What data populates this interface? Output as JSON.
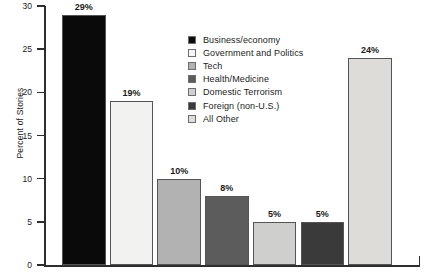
{
  "chart_data": {
    "type": "bar",
    "title": "",
    "xlabel": "",
    "ylabel": "Percent of Stories",
    "ylim": [
      0,
      30
    ],
    "ytick_step": 5,
    "ytick_labels": [
      "0",
      "5",
      "10",
      "15",
      "20",
      "25",
      "30"
    ],
    "grid": false,
    "legend_position": "inside-top-center",
    "categories": [
      "Business/economy",
      "Government and Politics",
      "Tech",
      "Health/Medicine",
      "Domestic Terrorism",
      "Foreign (non-U.S.)",
      "All Other"
    ],
    "values": [
      29,
      19,
      10,
      8,
      5,
      5,
      24
    ],
    "data_labels": [
      "29%",
      "19%",
      "10%",
      "8%",
      "5%",
      "5%",
      "24%"
    ],
    "colors": [
      "#0a0a0a",
      "#f2f2f0",
      "#b2b2b2",
      "#5c5c5c",
      "#cfcfcd",
      "#3a3a3a",
      "#dedcd8"
    ]
  },
  "axis": {
    "y_title": "Percent of Stories",
    "ticks": [
      {
        "label": "30",
        "value": 30
      },
      {
        "label": "25",
        "value": 25
      },
      {
        "label": "20",
        "value": 20
      },
      {
        "label": "15",
        "value": 15
      },
      {
        "label": "10",
        "value": 10
      },
      {
        "label": "5",
        "value": 5
      },
      {
        "label": "0",
        "value": 0
      }
    ]
  },
  "legend": {
    "items": [
      {
        "label": "Business/economy",
        "color": "#0a0a0a"
      },
      {
        "label": "Government and Politics",
        "color": "#f6f6f4"
      },
      {
        "label": "Tech",
        "color": "#b2b2b2"
      },
      {
        "label": "Health/Medicine",
        "color": "#5c5c5c"
      },
      {
        "label": "Domestic Terrorism",
        "color": "#cfcfcd"
      },
      {
        "label": "Foreign (non-U.S.)",
        "color": "#3a3a3a"
      },
      {
        "label": "All Other",
        "color": "#dedcd8"
      }
    ]
  }
}
